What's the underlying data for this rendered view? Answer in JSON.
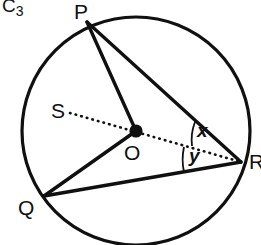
{
  "figure": {
    "name": "C",
    "subscript": "3",
    "caption_text": "C3",
    "stroke_color": "#101010",
    "background_color": "#ffffff"
  },
  "circle": {
    "name": "main-circle",
    "center_x": 136,
    "center_y": 131,
    "radius": 114,
    "stroke_width": 3
  },
  "points": {
    "P": {
      "label": "P",
      "x": 87,
      "y": 22,
      "on_circle": true
    },
    "Q": {
      "label": "Q",
      "x": 44,
      "y": 196,
      "on_circle": true
    },
    "R": {
      "label": "R",
      "x": 241,
      "y": 162,
      "on_circle": true
    },
    "S": {
      "label": "S",
      "x": 70,
      "y": 113,
      "on_circle": false
    },
    "O": {
      "label": "O",
      "x": 136,
      "y": 131,
      "on_circle": false,
      "is_center": true
    }
  },
  "segments": [
    {
      "name": "segment-PR",
      "from": "P",
      "to": "R",
      "style": "solid"
    },
    {
      "name": "segment-PO",
      "from": "P",
      "to": "O",
      "style": "solid"
    },
    {
      "name": "segment-OQ",
      "from": "O",
      "to": "Q",
      "style": "solid"
    },
    {
      "name": "segment-QR",
      "from": "Q",
      "to": "R",
      "style": "solid"
    },
    {
      "name": "segment-SR",
      "from": "S",
      "to": "R",
      "style": "dotted"
    }
  ],
  "angles": {
    "x": {
      "label": "x",
      "vertex": "R",
      "between": "PR and SR"
    },
    "y": {
      "label": "y",
      "vertex": "R",
      "between": "SR and QR"
    }
  }
}
